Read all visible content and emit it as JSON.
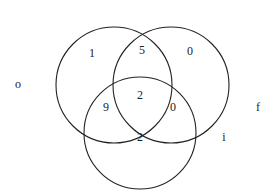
{
  "diagram": {
    "type": "venn-3",
    "sets": [
      {
        "name": "o",
        "cx": 114,
        "cy": 85,
        "r": 58
      },
      {
        "name": "f",
        "cx": 171,
        "cy": 85,
        "r": 58
      },
      {
        "name": "i",
        "cx": 140,
        "cy": 133,
        "r": 56
      }
    ],
    "set_labels": {
      "o": {
        "text": "o",
        "x": 18,
        "y": 84
      },
      "f": {
        "text": "f",
        "x": 258,
        "y": 107
      },
      "i": {
        "text": "i",
        "x": 224,
        "y": 137
      }
    },
    "regions": {
      "o_only": {
        "value": "1",
        "x": 92,
        "y": 53
      },
      "o_and_f": {
        "value": "5",
        "x": 142,
        "y": 50
      },
      "f_only": {
        "value": "0",
        "x": 190,
        "y": 51
      },
      "o_and_i": {
        "value": "9",
        "x": 106,
        "y": 107
      },
      "o_f_i": {
        "value": "2",
        "x": 140,
        "y": 95
      },
      "f_and_i": {
        "value": "0",
        "x": 173,
        "y": 107
      },
      "i_only": {
        "value": "2",
        "x": 140,
        "y": 137
      }
    },
    "stroke_color": "#222222"
  }
}
